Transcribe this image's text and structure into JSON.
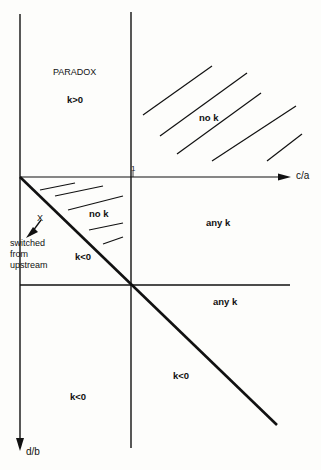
{
  "diagram": {
    "axes": {
      "x_label": "c/a",
      "y_label": "d/b",
      "tick_label": "1"
    },
    "regions": {
      "paradox_title": "PARADOX",
      "paradox_k": "k>0",
      "top_right": "no k",
      "triangle": "no k",
      "triangle_lower": "k<0",
      "mid_right": "any k",
      "lower_right_band": "any k",
      "bottom_left": "k<0",
      "bottom_right": "k<0"
    },
    "annotation": {
      "marker": "X",
      "text": "switched from upstream"
    },
    "colors": {
      "line": "#111111",
      "background": "#fdfdfb"
    }
  }
}
